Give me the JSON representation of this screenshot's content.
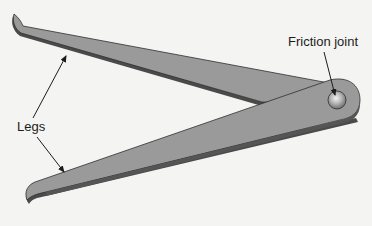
{
  "figure": {
    "labels": {
      "friction_joint": "Friction joint",
      "legs": "Legs"
    },
    "parts": [
      {
        "name": "upper-leg",
        "description": "Tapered leg with hooked tip, top left"
      },
      {
        "name": "lower-leg",
        "description": "Tapered leg with hooked tip, bottom left"
      },
      {
        "name": "friction-joint",
        "description": "Rivet pivot joining both legs at right"
      }
    ],
    "colors": {
      "background": "#f4f4f2",
      "leg_fill": "#9a9a9a",
      "leg_shadow": "#4a4a4a",
      "outline": "#2e2e2e",
      "rivet_highlight": "#e8e8e8",
      "text": "#1c1c1c"
    }
  }
}
